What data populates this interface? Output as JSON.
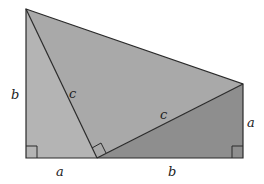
{
  "diagram": {
    "colors": {
      "left_triangle": "#b4b4b4",
      "middle_triangle": "#a9a9a9",
      "right_triangle": "#8e8e8e",
      "stroke": "#2a2a2a"
    },
    "labels": {
      "left_side": "b",
      "left_hyp": "c",
      "bottom_left": "a",
      "mid_hyp": "c",
      "bottom_right": "b",
      "right_side": "a"
    }
  }
}
